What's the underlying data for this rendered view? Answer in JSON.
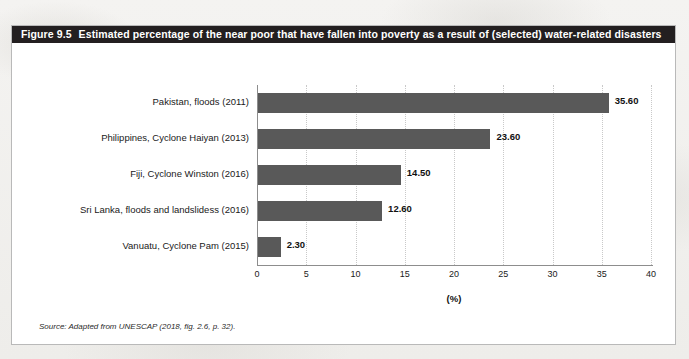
{
  "figure": {
    "number": "Figure 9.5",
    "title": "Estimated percentage of the near poor that have fallen into poverty as a result of (selected) water-related disasters",
    "source_note": "Source: Adapted from UNESCAP (2018, fig. 2.6, p. 32).",
    "title_bar_color": "#231f20",
    "bar_color": "#595959"
  },
  "chart_data": {
    "type": "bar",
    "orientation": "horizontal",
    "title": "Estimated percentage of the near poor that have fallen into poverty as a result of (selected) water-related disasters",
    "subtitle": "",
    "categories": [
      "Pakistan, floods (2011)",
      "Philippines, Cyclone Haiyan (2013)",
      "Fiji, Cyclone Winston (2016)",
      "Sri Lanka, floods and landslidess (2016)",
      "Vanuatu, Cyclone Pam (2015)"
    ],
    "values": [
      35.6,
      23.6,
      14.5,
      12.6,
      2.3
    ],
    "data_labels": [
      "35.60",
      "23.60",
      "14.50",
      "12.60",
      "2.30"
    ],
    "xlabel": "(%)",
    "ylabel": "",
    "xlim": [
      0,
      40
    ],
    "xticks": [
      0,
      5,
      10,
      15,
      20,
      25,
      30,
      35,
      40
    ],
    "xtick_labels": [
      "0",
      "5",
      "10",
      "15",
      "20",
      "25",
      "30",
      "35",
      "40"
    ],
    "grid": "vertical-dotted",
    "legend": "none"
  }
}
